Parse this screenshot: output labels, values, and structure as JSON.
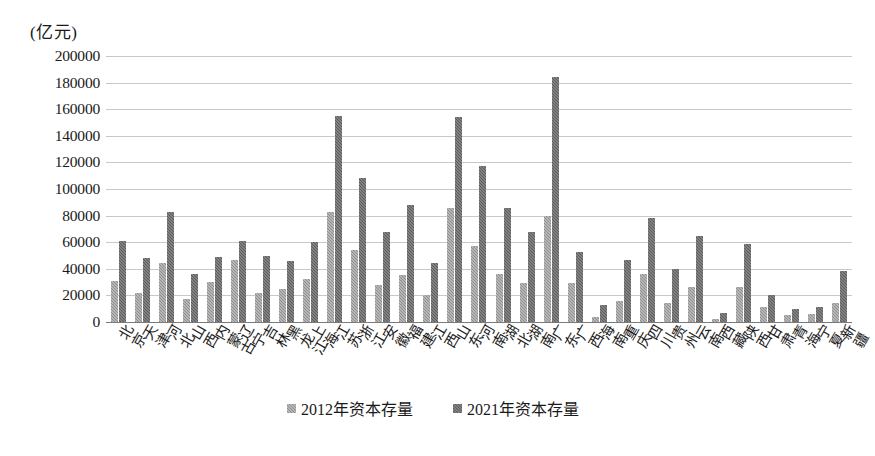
{
  "chart_data": {
    "type": "bar",
    "title": "",
    "subtitle": "",
    "unit_caption": "(亿元)",
    "xlabel": "",
    "ylabel": "",
    "ylim": [
      0,
      200000
    ],
    "ytick_step": 20000,
    "yticks": [
      "200000",
      "180000",
      "160000",
      "140000",
      "120000",
      "100000",
      "80000",
      "60000",
      "40000",
      "20000",
      "0"
    ],
    "grid": true,
    "legend_position": "bottom-center",
    "categories": [
      "北京",
      "天津",
      "河北",
      "山西",
      "内蒙古",
      "辽宁",
      "吉林",
      "黑龙江",
      "上海",
      "江苏",
      "浙江",
      "安徽",
      "福建",
      "江西",
      "山东",
      "河南",
      "湖北",
      "湖南",
      "广东",
      "广西",
      "海南",
      "重庆",
      "四川",
      "贵州",
      "云南",
      "西藏",
      "陕西",
      "甘肃",
      "青海",
      "宁夏",
      "新疆"
    ],
    "series": [
      {
        "name": "2012年资本存量",
        "color": "#8f8f8f",
        "values": [
          31000,
          22000,
          44000,
          17000,
          30000,
          47000,
          22000,
          25000,
          32000,
          83000,
          54000,
          28000,
          35000,
          20000,
          86000,
          57000,
          36000,
          29000,
          80000,
          29000,
          4000,
          16000,
          36000,
          14000,
          26000,
          2500,
          26000,
          11000,
          5000,
          6000,
          14000
        ]
      },
      {
        "name": "2021年资本存量",
        "color": "#5d5d5d",
        "values": [
          61000,
          48000,
          83000,
          36000,
          49000,
          61000,
          50000,
          46000,
          60000,
          155000,
          108000,
          68000,
          88000,
          44000,
          154000,
          117000,
          86000,
          68000,
          184000,
          53000,
          13000,
          47000,
          78000,
          40000,
          65000,
          7000,
          59000,
          20000,
          10000,
          11000,
          38000
        ]
      }
    ]
  },
  "legend": {
    "items": [
      {
        "label": "2012年资本存量",
        "swatch": "series-2012-swatch"
      },
      {
        "label": "2021年资本存量",
        "swatch": "series-2021-swatch"
      }
    ]
  }
}
